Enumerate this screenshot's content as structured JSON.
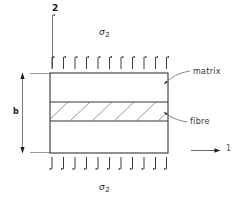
{
  "figure": {
    "type": "engineering-diagram",
    "background_color": "#ffffff",
    "line_color": "#333333"
  },
  "axes": {
    "vertical": {
      "label": "2",
      "x": 53,
      "y": 8
    },
    "horizontal": {
      "label": "1",
      "x": 227,
      "y": 146
    }
  },
  "loads": {
    "top": {
      "label": "σ",
      "subscript": "2",
      "arrow_count": 11,
      "direction": "up"
    },
    "bottom": {
      "label": "σ",
      "subscript": "2",
      "arrow_count": 11,
      "direction": "down"
    }
  },
  "dimension": {
    "label": "b",
    "orientation": "vertical",
    "x": 14,
    "y": 108
  },
  "callouts": [
    {
      "label": "matrix",
      "x": 193,
      "y": 72
    },
    {
      "label": "fibre",
      "x": 190,
      "y": 121
    }
  ],
  "block": {
    "left": 50,
    "right": 168,
    "top": 73,
    "bottom": 153,
    "fibre_band": {
      "top": 102,
      "bottom": 121
    },
    "hatch_count": 6
  }
}
